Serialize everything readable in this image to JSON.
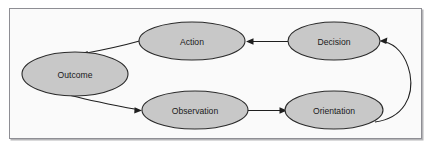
{
  "diagram": {
    "frame": {
      "border_color": "#8e8e94",
      "background_color": "#fafafa"
    },
    "style": {
      "node_fill": "#c8c8c8",
      "node_stroke": "#2a2a2a",
      "edge_color": "#1f1f1f",
      "label_color": "#1a1a1a"
    },
    "nodes": [
      {
        "id": "action",
        "label": "Action",
        "cx": 192,
        "cy": 41,
        "rx": 53,
        "ry": 19
      },
      {
        "id": "decision",
        "label": "Decision",
        "cx": 334,
        "cy": 41,
        "rx": 46,
        "ry": 19
      },
      {
        "id": "outcome",
        "label": "Outcome",
        "cx": 75,
        "cy": 74,
        "rx": 53,
        "ry": 22
      },
      {
        "id": "observation",
        "label": "Observation",
        "cx": 195,
        "cy": 110,
        "rx": 53,
        "ry": 19
      },
      {
        "id": "orientation",
        "label": "Orientation",
        "cx": 334,
        "cy": 110,
        "rx": 49,
        "ry": 19
      }
    ],
    "edges": [
      {
        "id": "decision-to-action",
        "from": "Decision",
        "to": "Action",
        "shape": "straight",
        "direction": "left"
      },
      {
        "id": "action-to-outcome",
        "from": "Action",
        "to": "Outcome",
        "shape": "curve",
        "direction": "left-down"
      },
      {
        "id": "outcome-to-observation",
        "from": "Outcome",
        "to": "Observation",
        "shape": "curve",
        "direction": "right-down"
      },
      {
        "id": "observation-to-orientation",
        "from": "Observation",
        "to": "Orientation",
        "shape": "straight",
        "direction": "right"
      },
      {
        "id": "orientation-to-decision",
        "from": "Orientation",
        "to": "Decision",
        "shape": "curve",
        "direction": "up-left"
      }
    ]
  }
}
